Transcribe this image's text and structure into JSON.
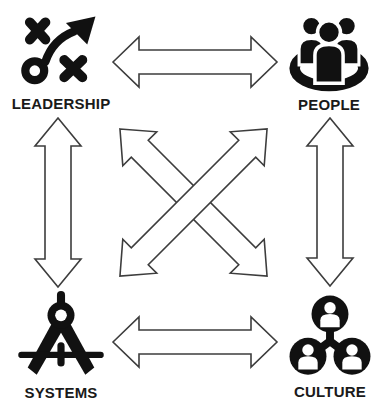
{
  "diagram": {
    "background_color": "#ffffff",
    "icon_color": "#111111",
    "arrow_outline_color": "#3d3d3d",
    "label_color": "#1a1a1a",
    "nodes": [
      {
        "id": "leadership",
        "label": "LEADERSHIP",
        "icon": "strategy-icon",
        "position": "top-left"
      },
      {
        "id": "people",
        "label": "PEOPLE",
        "icon": "group-icon",
        "position": "top-right"
      },
      {
        "id": "systems",
        "label": "SYSTEMS",
        "icon": "compass-icon",
        "position": "bottom-left"
      },
      {
        "id": "culture",
        "label": "CULTURE",
        "icon": "network-icon",
        "position": "bottom-right"
      }
    ],
    "connections": [
      {
        "from": "leadership",
        "to": "people",
        "style": "outlined-double-arrow",
        "orientation": "horizontal"
      },
      {
        "from": "systems",
        "to": "culture",
        "style": "outlined-double-arrow",
        "orientation": "horizontal"
      },
      {
        "from": "leadership",
        "to": "systems",
        "style": "outlined-double-arrow",
        "orientation": "vertical"
      },
      {
        "from": "people",
        "to": "culture",
        "style": "outlined-double-arrow",
        "orientation": "vertical"
      },
      {
        "from": "leadership",
        "to": "culture",
        "style": "outlined-double-arrow",
        "orientation": "diagonal"
      },
      {
        "from": "systems",
        "to": "people",
        "style": "outlined-double-arrow",
        "orientation": "diagonal"
      }
    ]
  }
}
